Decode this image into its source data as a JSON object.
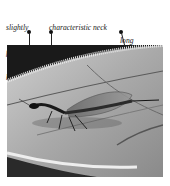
{
  "figure": {
    "labels": [
      {
        "id": "head",
        "lines": [
          "slightly",
          "flat",
          "head"
        ]
      },
      {
        "id": "neck",
        "lines": [
          "characteristic neck",
          "with elongated",
          "pronotum"
        ]
      },
      {
        "id": "ovipositor",
        "lines": [
          "long",
          "ovipositor"
        ]
      }
    ]
  }
}
